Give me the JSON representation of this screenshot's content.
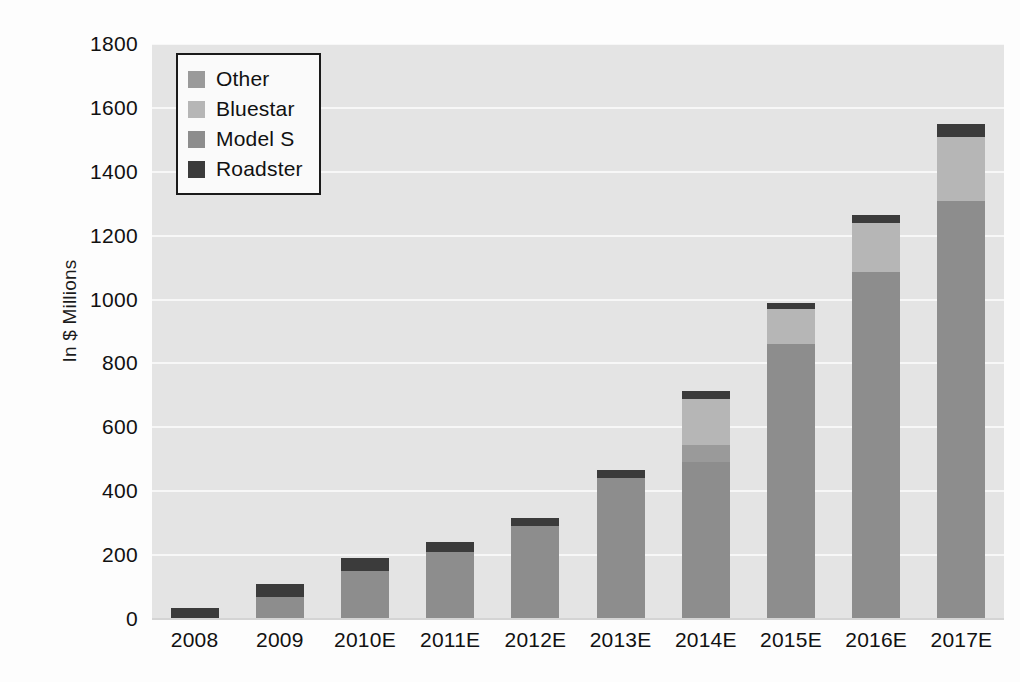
{
  "chart_data": {
    "type": "bar",
    "stacked": true,
    "title": "",
    "xlabel": "",
    "ylabel": "In $ Millions",
    "ylim": [
      0,
      1800
    ],
    "ytick_step": 200,
    "yticks": [
      "1800",
      "1600",
      "1400",
      "1200",
      "1000",
      "800",
      "600",
      "400",
      "200",
      "0"
    ],
    "grid": true,
    "legend_position": "upper-left",
    "categories": [
      "2008",
      "2009",
      "2010E",
      "2011E",
      "2012E",
      "2013E",
      "2014E",
      "2015E",
      "2016E",
      "2017E"
    ],
    "series": [
      {
        "name": "Roadster",
        "color": "#3b3b3b",
        "values": [
          35,
          40,
          40,
          30,
          25,
          25,
          25,
          20,
          25,
          40
        ]
      },
      {
        "name": "Model S",
        "color": "#8d8d8d",
        "values": [
          0,
          70,
          150,
          210,
          290,
          440,
          490,
          860,
          1085,
          1310
        ]
      },
      {
        "name": "Bluestar",
        "color": "#b6b6b6",
        "values": [
          0,
          0,
          0,
          0,
          0,
          0,
          145,
          110,
          155,
          200
        ]
      },
      {
        "name": "Other",
        "color": "#9a9a9a",
        "values": [
          0,
          0,
          0,
          0,
          0,
          0,
          55,
          0,
          0,
          0
        ]
      }
    ],
    "totals": [
      35,
      110,
      190,
      240,
      315,
      465,
      715,
      990,
      1265,
      1550
    ],
    "stack_order": [
      "Model S",
      "Other",
      "Bluestar",
      "Roadster"
    ]
  },
  "legend": {
    "entries": [
      {
        "label": "Other",
        "color": "#9a9a9a"
      },
      {
        "label": "Bluestar",
        "color": "#b6b6b6"
      },
      {
        "label": "Model S",
        "color": "#8d8d8d"
      },
      {
        "label": "Roadster",
        "color": "#3b3b3b"
      }
    ]
  },
  "colors": {
    "plot_background": "#e4e4e4",
    "gridline": "#f7f7f7",
    "page_background": "#fdfdfd",
    "text": "#111111",
    "legend_border": "#1a1a1a"
  }
}
